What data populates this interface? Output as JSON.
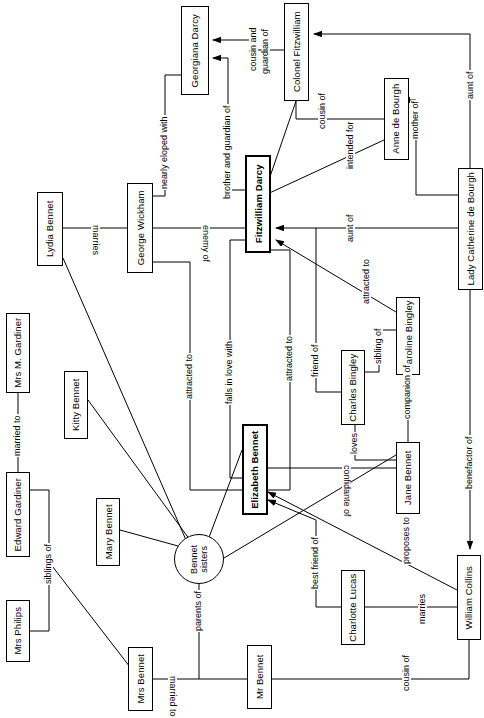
{
  "diagram": {
    "orientation": "rotated-90-ccw",
    "width": 484,
    "height": 718,
    "background_color": "#ffffff",
    "line_color": "#000000",
    "text_color": "#000000",
    "nodes": [
      {
        "id": "georgiana",
        "label": "Georgiana Darcy",
        "shape": "box",
        "emphasis": false,
        "x": 181,
        "y": 6,
        "w": 28,
        "h": 89
      },
      {
        "id": "colfitz",
        "label": "Colonel Fitzwilliam",
        "shape": "box",
        "emphasis": false,
        "x": 284,
        "y": 3,
        "w": 25,
        "h": 98
      },
      {
        "id": "anne",
        "label": "Anne de Bourgh",
        "shape": "box",
        "emphasis": false,
        "x": 384,
        "y": 78,
        "w": 25,
        "h": 82
      },
      {
        "id": "ladycath",
        "label": "Lady Catherine de Bourgh",
        "shape": "box",
        "emphasis": false,
        "x": 458,
        "y": 168,
        "w": 25,
        "h": 122
      },
      {
        "id": "wickham",
        "label": "George Wickham",
        "shape": "box",
        "emphasis": false,
        "x": 127,
        "y": 183,
        "w": 26,
        "h": 90
      },
      {
        "id": "darcy",
        "label": "Fitzwilliam Darcy",
        "shape": "box",
        "emphasis": true,
        "x": 245,
        "y": 155,
        "w": 26,
        "h": 98
      },
      {
        "id": "lydia",
        "label": "Lydia Bennet",
        "shape": "box",
        "emphasis": false,
        "x": 37,
        "y": 192,
        "w": 26,
        "h": 74
      },
      {
        "id": "mrsgardiner",
        "label": "Mrs M. Gardiner",
        "shape": "box",
        "emphasis": false,
        "x": 6,
        "y": 313,
        "w": 24,
        "h": 80
      },
      {
        "id": "kitty",
        "label": "Kitty Bennet",
        "shape": "box",
        "emphasis": false,
        "x": 64,
        "y": 371,
        "w": 24,
        "h": 68
      },
      {
        "id": "caroline",
        "label": "Caroline Bingley",
        "shape": "box",
        "emphasis": false,
        "x": 396,
        "y": 297,
        "w": 24,
        "h": 78
      },
      {
        "id": "charlesb",
        "label": "Charles Bingley",
        "shape": "box",
        "emphasis": false,
        "x": 341,
        "y": 350,
        "w": 24,
        "h": 75
      },
      {
        "id": "elizabeth",
        "label": "Elizabeth Bennet",
        "shape": "box",
        "emphasis": true,
        "x": 242,
        "y": 424,
        "w": 26,
        "h": 91
      },
      {
        "id": "jane",
        "label": "Jane Bennet",
        "shape": "box",
        "emphasis": false,
        "x": 396,
        "y": 442,
        "w": 24,
        "h": 72
      },
      {
        "id": "edwardg",
        "label": "Edward Gardiner",
        "shape": "box",
        "emphasis": false,
        "x": 6,
        "y": 472,
        "w": 24,
        "h": 85
      },
      {
        "id": "mary",
        "label": "Mary Bennet",
        "shape": "box",
        "emphasis": false,
        "x": 96,
        "y": 498,
        "w": 24,
        "h": 68
      },
      {
        "id": "bennetsis",
        "label": "Bennet sisters",
        "shape": "ellipse",
        "emphasis": false,
        "x": 174,
        "y": 534,
        "w": 50,
        "h": 50
      },
      {
        "id": "charlotte",
        "label": "Charlotte Lucas",
        "shape": "box",
        "emphasis": false,
        "x": 341,
        "y": 570,
        "w": 24,
        "h": 75
      },
      {
        "id": "collins",
        "label": "William Collins",
        "shape": "box",
        "emphasis": false,
        "x": 457,
        "y": 555,
        "w": 24,
        "h": 85
      },
      {
        "id": "mrsphilips",
        "label": "Mrs Philips",
        "shape": "box",
        "emphasis": false,
        "x": 6,
        "y": 600,
        "w": 24,
        "h": 62
      },
      {
        "id": "mrsbennet",
        "label": "Mrs Bennet",
        "shape": "box",
        "emphasis": false,
        "x": 128,
        "y": 647,
        "w": 25,
        "h": 64
      },
      {
        "id": "mrbennet",
        "label": "Mr Bennet",
        "shape": "box",
        "emphasis": false,
        "x": 247,
        "y": 645,
        "w": 25,
        "h": 64
      }
    ],
    "edge_labels": [
      {
        "id": "lbl-cousin-guardian",
        "text": "cousin and\nguardian of",
        "line1": "cousin and",
        "line2": "guardian of",
        "x": 254,
        "y": 22,
        "rot": "ccw"
      },
      {
        "id": "lbl-aunt-of-1",
        "text": "aunt of",
        "x": 431,
        "y": 70,
        "rot": "ccw"
      },
      {
        "id": "lbl-cousin-of",
        "text": "cousin of",
        "x": 324,
        "y": 95,
        "rot": "ccw"
      },
      {
        "id": "lbl-nearly-eloped",
        "text": "nearly eloped with",
        "x": 165,
        "y": 130,
        "rot": "ccw"
      },
      {
        "id": "lbl-brother-guardian",
        "text": "brother and guardian of",
        "x": 228,
        "y": 135,
        "rot": "ccw"
      },
      {
        "id": "lbl-mother-of",
        "text": "mother of",
        "x": 411,
        "y": 118,
        "rot": "ccw"
      },
      {
        "id": "lbl-intended-for",
        "text": "intended for",
        "x": 351,
        "y": 132,
        "rot": "ccw"
      },
      {
        "id": "lbl-marries-1",
        "text": "marries",
        "x": 88,
        "y": 233,
        "rot": "cw"
      },
      {
        "id": "lbl-enemy-of",
        "text": "enemy of",
        "x": 190,
        "y": 232,
        "rot": "cw"
      },
      {
        "id": "lbl-aunt-of-2",
        "text": "aunt of",
        "x": 351,
        "y": 213,
        "rot": "ccw"
      },
      {
        "id": "lbl-attracted-to-1",
        "text": "attracted to",
        "x": 190,
        "y": 355,
        "rot": "ccw"
      },
      {
        "id": "lbl-falls-in-love",
        "text": "falls in love with",
        "x": 230,
        "y": 355,
        "rot": "ccw"
      },
      {
        "id": "lbl-attracted-to-2",
        "text": "attracted to",
        "x": 290,
        "y": 340,
        "rot": "ccw"
      },
      {
        "id": "lbl-attracted-to-3",
        "text": "attracted to",
        "x": 367,
        "y": 265,
        "rot": "ccw"
      },
      {
        "id": "lbl-sibling-of",
        "text": "sibling of",
        "x": 379,
        "y": 330,
        "rot": "ccw"
      },
      {
        "id": "lbl-friend-of",
        "text": "friend of",
        "x": 316,
        "y": 345,
        "rot": "ccw"
      },
      {
        "id": "lbl-companion-of",
        "text": "companion of",
        "x": 379,
        "y": 425,
        "rot": "ccw"
      },
      {
        "id": "lbl-loves",
        "text": "loves",
        "x": 355,
        "y": 438,
        "rot": "ccw"
      },
      {
        "id": "lbl-confidante-of",
        "text": "confidante of",
        "x": 351,
        "y": 474,
        "rot": "cw"
      },
      {
        "id": "lbl-benefactor-of",
        "text": "benefactor of",
        "x": 451,
        "y": 447,
        "rot": "ccw"
      },
      {
        "id": "lbl-married-to-1",
        "text": "married to",
        "x": 16,
        "y": 430,
        "rot": "ccw"
      },
      {
        "id": "lbl-siblings-of",
        "text": "siblings of",
        "x": 49,
        "y": 562,
        "rot": "ccw"
      },
      {
        "id": "lbl-best-friend-of",
        "text": "best friend of",
        "x": 316,
        "y": 553,
        "rot": "ccw"
      },
      {
        "id": "lbl-proposes-to",
        "text": "proposes to",
        "x": 407,
        "y": 530,
        "rot": "ccw"
      },
      {
        "id": "lbl-marries-2",
        "text": "marries",
        "x": 423,
        "y": 597,
        "rot": "ccw"
      },
      {
        "id": "lbl-parents-of",
        "text": "parents of",
        "x": 190,
        "y": 605,
        "rot": "ccw"
      },
      {
        "id": "lbl-married-to-2",
        "text": "married to",
        "x": 224,
        "y": 681,
        "rot": "cw"
      },
      {
        "id": "lbl-cousin-of-2",
        "text": "cousin of",
        "x": 407,
        "y": 662,
        "rot": "ccw"
      }
    ]
  }
}
